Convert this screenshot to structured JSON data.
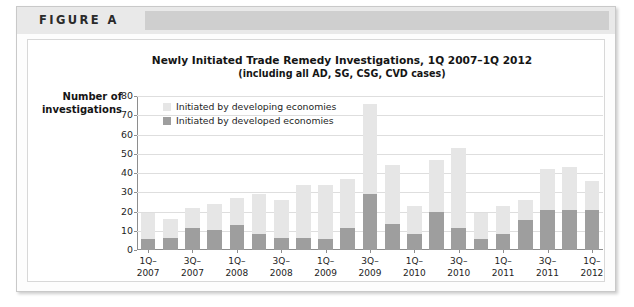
{
  "figure": {
    "label": "FIGURE A"
  },
  "chart_data": {
    "type": "bar",
    "stacked": true,
    "title": "Newly Initiated Trade Remedy Investigations, 1Q 2007–1Q 2012",
    "subtitle": "(including all AD, SG, CSG, CVD cases)",
    "xlabel": "",
    "ylabel": "Number of investigations",
    "ylim": [
      0,
      80
    ],
    "yticks": [
      0,
      10,
      20,
      30,
      40,
      50,
      60,
      70,
      80
    ],
    "grid": true,
    "legend_position": "top-left-inside",
    "categories": [
      "1Q-2007",
      "2Q-2007",
      "3Q-2007",
      "4Q-2007",
      "1Q-2008",
      "2Q-2008",
      "3Q-2008",
      "4Q-2008",
      "1Q-2009",
      "2Q-2009",
      "3Q-2009",
      "4Q-2009",
      "1Q-2010",
      "2Q-2010",
      "3Q-2010",
      "4Q-2010",
      "1Q-2011",
      "2Q-2011",
      "3Q-2011",
      "4Q-2011",
      "1Q-2012"
    ],
    "tick_labels": [
      {
        "index": 0,
        "line1": "1Q–",
        "line2": "2007"
      },
      {
        "index": 2,
        "line1": "3Q–",
        "line2": "2007"
      },
      {
        "index": 4,
        "line1": "1Q–",
        "line2": "2008"
      },
      {
        "index": 6,
        "line1": "3Q–",
        "line2": "2008"
      },
      {
        "index": 8,
        "line1": "1Q–",
        "line2": "2009"
      },
      {
        "index": 10,
        "line1": "3Q–",
        "line2": "2009"
      },
      {
        "index": 12,
        "line1": "1Q–",
        "line2": "2010"
      },
      {
        "index": 14,
        "line1": "3Q–",
        "line2": "2010"
      },
      {
        "index": 16,
        "line1": "1Q–",
        "line2": "2011"
      },
      {
        "index": 18,
        "line1": "3Q–",
        "line2": "2011"
      },
      {
        "index": 20,
        "line1": "1Q–",
        "line2": "2012"
      }
    ],
    "series": [
      {
        "name": "Initiated by developed economies",
        "color": "#9e9e9e",
        "values": [
          5.5,
          6.5,
          11.5,
          10.5,
          13,
          8.5,
          6.5,
          6.5,
          5.5,
          11.5,
          29,
          13.5,
          8.5,
          20,
          11.5,
          5.5,
          8.5,
          15.5,
          21,
          21,
          21
        ]
      },
      {
        "name": "Initiated by developing economies",
        "color": "#e6e6e6",
        "values": [
          13.5,
          9.5,
          10.5,
          13.5,
          14,
          20.5,
          19.5,
          27.5,
          28.5,
          25.5,
          47,
          30.5,
          14.5,
          27,
          41.5,
          13.5,
          14.5,
          10.5,
          21,
          22,
          15
        ]
      }
    ],
    "totals": [
      19,
      16,
      22,
      24,
      27,
      29,
      26,
      34,
      34,
      37,
      76,
      44,
      23,
      47,
      53,
      19,
      23,
      26,
      42,
      43,
      36
    ]
  }
}
